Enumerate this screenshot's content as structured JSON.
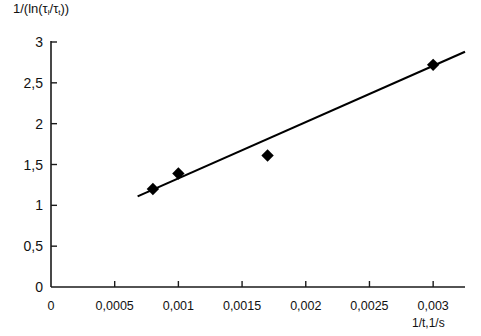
{
  "chart_data": {
    "type": "scatter",
    "title": "",
    "ylabel": "1/(ln(τ₁/τₜ))",
    "xlabel": "1/t,1/s",
    "ylabel_parts": {
      "prefix": "1/(ln(τ",
      "sub1": "l",
      "mid": "/τ",
      "sub2": "t",
      "suffix": "))"
    },
    "xlim": [
      0,
      0.00325
    ],
    "ylim": [
      0,
      3
    ],
    "x_ticks": [
      0,
      0.0005,
      0.001,
      0.0015,
      0.002,
      0.0025,
      0.003
    ],
    "x_tick_labels": [
      "0",
      "0,0005",
      "0,001",
      "0,0015",
      "0,002",
      "0,0025",
      "0,003"
    ],
    "y_ticks": [
      0,
      0.5,
      1,
      1.5,
      2,
      2.5,
      3
    ],
    "y_tick_labels": [
      "0",
      "0,5",
      "1",
      "1,5",
      "2",
      "2,5",
      "3"
    ],
    "grid": false,
    "legend": false,
    "marker": "diamond",
    "marker_color": "#000000",
    "line_color": "#000000",
    "x": [
      0.0008,
      0.001,
      0.0017,
      0.003
    ],
    "y": [
      1.2,
      1.39,
      1.61,
      2.72
    ],
    "points": [
      {
        "x": 0.0008,
        "y": 1.2
      },
      {
        "x": 0.001,
        "y": 1.39
      },
      {
        "x": 0.0017,
        "y": 1.61
      },
      {
        "x": 0.003,
        "y": 2.72
      }
    ],
    "trendline": {
      "type": "linear",
      "x_start": 0.00068,
      "y_start": 1.11,
      "x_end": 0.00325,
      "y_end": 2.88
    }
  }
}
